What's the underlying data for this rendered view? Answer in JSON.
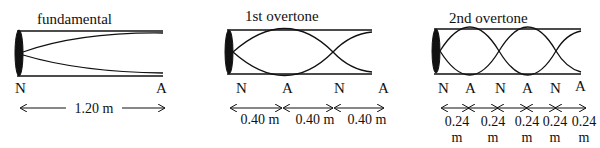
{
  "panels": [
    {
      "title": "fundamental",
      "node_labels": [
        "N",
        "A"
      ],
      "spacing_labels": [
        "1.20 m"
      ]
    },
    {
      "title": "1st overtone",
      "node_labels": [
        "N",
        "A",
        "N",
        "A"
      ],
      "spacing_labels": [
        "0.40 m",
        "0.40 m",
        "0.40 m"
      ]
    },
    {
      "title": "2nd overtone",
      "node_labels": [
        "N",
        "A",
        "N",
        "A",
        "N",
        "A"
      ],
      "spacing_values": [
        "0.24",
        "0.24",
        "0.24",
        "0.24",
        "0.24"
      ],
      "spacing_unit": "m"
    }
  ]
}
